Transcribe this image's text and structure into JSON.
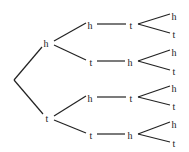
{
  "diagram": {
    "type": "probability-tree",
    "root": {
      "x": 14,
      "y": 80
    },
    "nodes": [
      {
        "id": "n1",
        "label": "h",
        "x": 46,
        "y": 43
      },
      {
        "id": "n2",
        "label": "t",
        "x": 47,
        "y": 118
      },
      {
        "id": "n11",
        "label": "h",
        "x": 90,
        "y": 25
      },
      {
        "id": "n12",
        "label": "t",
        "x": 91,
        "y": 62
      },
      {
        "id": "n21",
        "label": "h",
        "x": 90,
        "y": 98
      },
      {
        "id": "n22",
        "label": "t",
        "x": 91,
        "y": 135
      },
      {
        "id": "n111",
        "label": "t",
        "x": 131,
        "y": 25
      },
      {
        "id": "n121",
        "label": "h",
        "x": 130,
        "y": 62
      },
      {
        "id": "n211",
        "label": "t",
        "x": 131,
        "y": 98
      },
      {
        "id": "n221",
        "label": "h",
        "x": 130,
        "y": 135
      },
      {
        "id": "l1",
        "label": "h",
        "x": 174,
        "y": 16
      },
      {
        "id": "l2",
        "label": "t",
        "x": 174,
        "y": 34
      },
      {
        "id": "l3",
        "label": "h",
        "x": 174,
        "y": 52
      },
      {
        "id": "l4",
        "label": "t",
        "x": 174,
        "y": 71
      },
      {
        "id": "l5",
        "label": "h",
        "x": 174,
        "y": 88
      },
      {
        "id": "l6",
        "label": "t",
        "x": 174,
        "y": 106
      },
      {
        "id": "l7",
        "label": "h",
        "x": 174,
        "y": 124
      },
      {
        "id": "l8",
        "label": "t",
        "x": 174,
        "y": 143
      }
    ],
    "edges": [
      [
        14,
        80,
        42,
        47
      ],
      [
        14,
        80,
        43,
        114
      ],
      [
        54,
        41,
        86,
        23
      ],
      [
        54,
        45,
        86,
        60
      ],
      [
        54,
        116,
        86,
        96
      ],
      [
        54,
        120,
        86,
        133
      ],
      [
        97,
        24,
        126,
        24
      ],
      [
        97,
        61,
        125,
        61
      ],
      [
        97,
        97,
        126,
        97
      ],
      [
        97,
        134,
        125,
        134
      ],
      [
        138,
        24,
        170,
        14
      ],
      [
        138,
        24,
        170,
        33
      ],
      [
        138,
        61,
        170,
        50
      ],
      [
        138,
        61,
        170,
        70
      ],
      [
        138,
        97,
        170,
        86
      ],
      [
        138,
        97,
        170,
        105
      ],
      [
        138,
        134,
        170,
        122
      ],
      [
        138,
        134,
        170,
        142
      ]
    ]
  }
}
